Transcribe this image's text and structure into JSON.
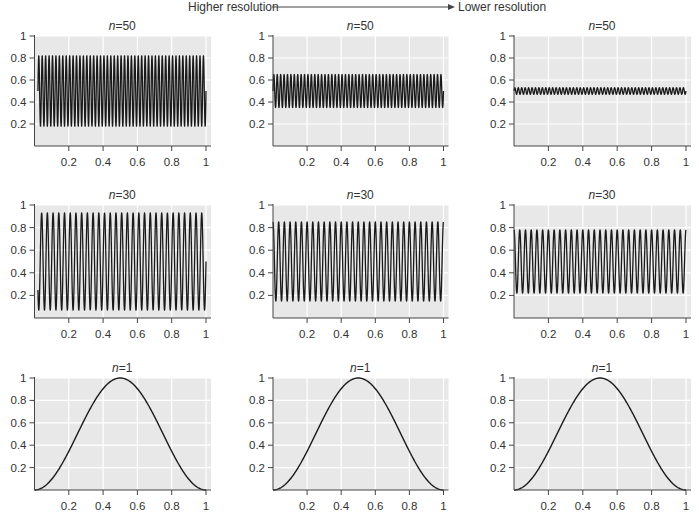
{
  "header": {
    "left_label": "Higher resolution",
    "right_label": "Lower resolution",
    "arrow": "right-arrow"
  },
  "colors": {
    "panel_background": "#e8e8e8",
    "gridline": "#ffffff",
    "curve": "#1a1a1a",
    "axis": "#444444",
    "text": "#333333"
  },
  "chart_data": [
    {
      "type": "line",
      "row": 1,
      "col": 1,
      "title_prefix": "n",
      "title_value": "=50",
      "function": "0.5 + amplitude*sin(2*pi*cycles*x + phase)",
      "cycles": 50,
      "center": 0.5,
      "amplitude": 0.32,
      "phase": 0,
      "x_range": [
        0.02,
        1.0
      ],
      "xlim": [
        0,
        1
      ],
      "ylim": [
        0,
        1
      ],
      "xticks": [
        "0.2",
        "0.4",
        "0.6",
        "0.8",
        "1"
      ],
      "yticks": [
        "0.2",
        "0.4",
        "0.6",
        "0.8",
        "1"
      ],
      "grid": true,
      "xlabel": "",
      "ylabel": ""
    },
    {
      "type": "line",
      "row": 1,
      "col": 2,
      "title_prefix": "n",
      "title_value": "=50",
      "function": "0.5 + amplitude*sin(2*pi*cycles*x + phase)",
      "cycles": 50,
      "center": 0.5,
      "amplitude": 0.15,
      "phase": 0,
      "x_range": [
        0.0,
        1.0
      ],
      "xlim": [
        0,
        1
      ],
      "ylim": [
        0,
        1
      ],
      "xticks": [
        "0.2",
        "0.4",
        "0.6",
        "0.8",
        "1"
      ],
      "yticks": [
        "0.2",
        "0.4",
        "0.6",
        "0.8",
        "1"
      ],
      "grid": true,
      "xlabel": "",
      "ylabel": ""
    },
    {
      "type": "line",
      "row": 1,
      "col": 3,
      "title_prefix": "n",
      "title_value": "=50",
      "function": "0.5 + amplitude*sin(2*pi*cycles*x + phase)",
      "cycles": 50,
      "center": 0.5,
      "amplitude": 0.03,
      "phase": 0,
      "x_range": [
        0.0,
        1.0
      ],
      "xlim": [
        0,
        1
      ],
      "ylim": [
        0,
        1
      ],
      "xticks": [
        "0.2",
        "0.4",
        "0.6",
        "0.8",
        "1"
      ],
      "yticks": [
        "0.2",
        "0.4",
        "0.6",
        "0.8",
        "1"
      ],
      "grid": true,
      "xlabel": "",
      "ylabel": ""
    },
    {
      "type": "line",
      "row": 2,
      "col": 1,
      "title_prefix": "n",
      "title_value": "=30",
      "function": "0.5 + amplitude*sin(2*pi*cycles*x + phase)",
      "cycles": 30,
      "center": 0.5,
      "amplitude": 0.43,
      "phase": 0,
      "x_range": [
        0.02,
        1.0
      ],
      "xlim": [
        0,
        1
      ],
      "ylim": [
        0,
        1
      ],
      "xticks": [
        "0.2",
        "0.4",
        "0.6",
        "0.8",
        "1"
      ],
      "yticks": [
        "0.2",
        "0.4",
        "0.6",
        "0.8",
        "1"
      ],
      "grid": true,
      "xlabel": "",
      "ylabel": ""
    },
    {
      "type": "line",
      "row": 2,
      "col": 2,
      "title_prefix": "n",
      "title_value": "=30",
      "function": "0.5 + amplitude*sin(2*pi*cycles*x + phase)",
      "cycles": 30,
      "center": 0.5,
      "amplitude": 0.35,
      "phase": 1.5708,
      "x_range": [
        0.0,
        1.0
      ],
      "xlim": [
        0,
        1
      ],
      "ylim": [
        0,
        1
      ],
      "xticks": [
        "0.2",
        "0.4",
        "0.6",
        "0.8",
        "1"
      ],
      "yticks": [
        "0.2",
        "0.4",
        "0.6",
        "0.8",
        "1"
      ],
      "grid": true,
      "xlabel": "",
      "ylabel": ""
    },
    {
      "type": "line",
      "row": 2,
      "col": 3,
      "title_prefix": "n",
      "title_value": "=30",
      "function": "0.5 + amplitude*sin(2*pi*cycles*x + phase)",
      "cycles": 30,
      "center": 0.5,
      "amplitude": 0.28,
      "phase": 1.5708,
      "x_range": [
        0.0,
        1.0
      ],
      "xlim": [
        0,
        1
      ],
      "ylim": [
        0,
        1
      ],
      "xticks": [
        "0.2",
        "0.4",
        "0.6",
        "0.8",
        "1"
      ],
      "yticks": [
        "0.2",
        "0.4",
        "0.6",
        "0.8",
        "1"
      ],
      "grid": true,
      "xlabel": "",
      "ylabel": ""
    },
    {
      "type": "line",
      "row": 3,
      "col": 1,
      "title_prefix": "n",
      "title_value": "=1",
      "function": "0.5 + amplitude*sin(2*pi*cycles*x + phase)",
      "cycles": 1,
      "center": 0.5,
      "amplitude": 0.5,
      "phase": -1.5708,
      "x_range": [
        0.0,
        1.0
      ],
      "xlim": [
        0,
        1
      ],
      "ylim": [
        0,
        1
      ],
      "xticks": [
        "0.2",
        "0.4",
        "0.6",
        "0.8",
        "1"
      ],
      "yticks": [
        "0.2",
        "0.4",
        "0.6",
        "0.8",
        "1"
      ],
      "grid": true,
      "xlabel": "",
      "ylabel": ""
    },
    {
      "type": "line",
      "row": 3,
      "col": 2,
      "title_prefix": "n",
      "title_value": "=1",
      "function": "0.5 + amplitude*sin(2*pi*cycles*x + phase)",
      "cycles": 1,
      "center": 0.5,
      "amplitude": 0.5,
      "phase": -1.5708,
      "x_range": [
        0.0,
        1.0
      ],
      "xlim": [
        0,
        1
      ],
      "ylim": [
        0,
        1
      ],
      "xticks": [
        "0.2",
        "0.4",
        "0.6",
        "0.8",
        "1"
      ],
      "yticks": [
        "0.2",
        "0.4",
        "0.6",
        "0.8",
        "1"
      ],
      "grid": true,
      "xlabel": "",
      "ylabel": ""
    },
    {
      "type": "line",
      "row": 3,
      "col": 3,
      "title_prefix": "n",
      "title_value": "=1",
      "function": "0.5 + amplitude*sin(2*pi*cycles*x + phase)",
      "cycles": 1,
      "center": 0.5,
      "amplitude": 0.5,
      "phase": -1.5708,
      "x_range": [
        0.0,
        1.0
      ],
      "xlim": [
        0,
        1
      ],
      "ylim": [
        0,
        1
      ],
      "xticks": [
        "0.2",
        "0.4",
        "0.6",
        "0.8",
        "1"
      ],
      "yticks": [
        "0.2",
        "0.4",
        "0.6",
        "0.8",
        "1"
      ],
      "grid": true,
      "xlabel": "",
      "ylabel": ""
    }
  ]
}
